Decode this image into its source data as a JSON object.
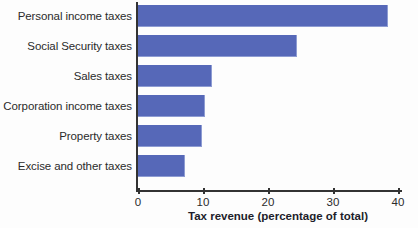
{
  "chart_data": {
    "type": "bar",
    "orientation": "horizontal",
    "title": "",
    "categories": [
      "Personal income taxes",
      "Social Security taxes",
      "Sales taxes",
      "Corporation income taxes",
      "Property taxes",
      "Excise and other taxes"
    ],
    "values": [
      38.5,
      24.5,
      11.4,
      10.3,
      9.8,
      7.2
    ],
    "xlabel": "Tax revenue (percentage of total)",
    "ylabel": "",
    "xlim": [
      0,
      40
    ],
    "xticks": [
      0,
      10,
      20,
      30,
      40
    ],
    "xtick_labels": [
      "0",
      "10",
      "20",
      "30",
      "40"
    ],
    "grid": false,
    "legend": false,
    "bar_color": "#5668b8",
    "axis_color": "#333333",
    "text_color": "#2b2b2b"
  }
}
